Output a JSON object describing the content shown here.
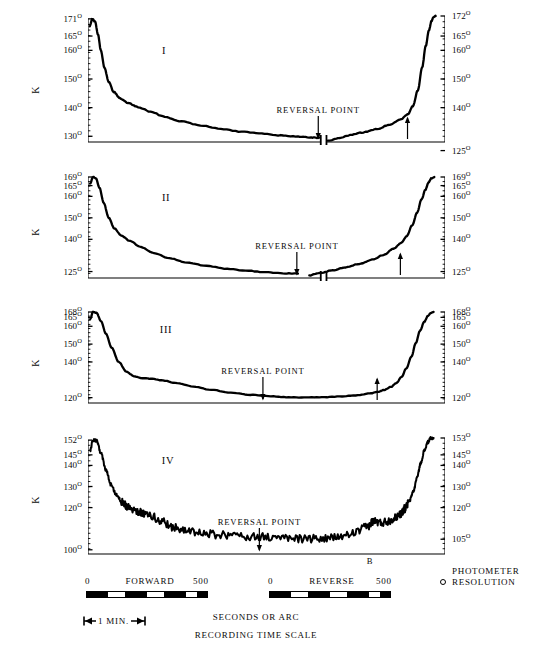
{
  "figure": {
    "axis_title": "K",
    "reversal_label": "REVERSAL POINT",
    "b_marker": "B"
  },
  "legend": {
    "forward_label": "FORWARD",
    "reverse_label": "REVERSE",
    "forward_start": "0",
    "forward_end": "500",
    "reverse_start": "0",
    "reverse_end": "500",
    "units_label": "SECONDS OR ARC",
    "time_scale_label": "RECORDING TIME SCALE",
    "minute_label": "1 MIN.",
    "photometer_line1": "PHOTOMETER",
    "photometer_line2": "RESOLUTION"
  },
  "chart_data": {
    "type": "line",
    "title": "",
    "xlabel": "SECONDS OR ARC",
    "ylabel": "K",
    "grid": false,
    "legend_position": "none",
    "panels": [
      {
        "name": "I",
        "left_axis_ticks": [
          "171",
          "165",
          "160",
          "150",
          "140",
          "130"
        ],
        "left_axis_values": [
          171,
          165,
          160,
          150,
          140,
          130
        ],
        "right_axis_ticks": [
          "172",
          "165",
          "160",
          "150",
          "140",
          "125"
        ],
        "right_axis_values": [
          172,
          165,
          160,
          150,
          140,
          125
        ],
        "ylim": [
          128,
          172
        ],
        "has_trace_break": true,
        "reversal_point_x_frac": 0.645,
        "arrow_right_x_frac": 0.895,
        "forward": {
          "x_frac": [
            0.005,
            0.012,
            0.02,
            0.028,
            0.036,
            0.046,
            0.058,
            0.072,
            0.09,
            0.112,
            0.14,
            0.175,
            0.215,
            0.262,
            0.315,
            0.372,
            0.43,
            0.487,
            0.54,
            0.588,
            0.625,
            0.648
          ],
          "values": [
            168.5,
            171.0,
            170.0,
            165.5,
            160.0,
            154.0,
            149.0,
            145.5,
            143.2,
            141.6,
            140.2,
            138.6,
            136.8,
            135.2,
            133.8,
            132.6,
            131.6,
            130.9,
            130.3,
            129.9,
            129.6,
            129.5
          ]
        },
        "reverse": {
          "x_frac": [
            0.672,
            0.7,
            0.735,
            0.772,
            0.81,
            0.845,
            0.875,
            0.895,
            0.91,
            0.924,
            0.936,
            0.946,
            0.955,
            0.962,
            0.968,
            0.974
          ],
          "values": [
            128.4,
            129.4,
            130.4,
            131.4,
            132.6,
            134.0,
            135.8,
            137.6,
            140.5,
            146.0,
            154.0,
            161.5,
            167.0,
            170.2,
            171.7,
            172.0
          ]
        }
      },
      {
        "name": "II",
        "left_axis_ticks": [
          "169",
          "165",
          "160",
          "150",
          "140",
          "125"
        ],
        "left_axis_values": [
          169,
          165,
          160,
          150,
          140,
          125
        ],
        "right_axis_ticks": [
          "169",
          "165",
          "160",
          "150",
          "140",
          "125"
        ],
        "right_axis_values": [
          169,
          165,
          160,
          150,
          140,
          125
        ],
        "ylim": [
          122,
          169
        ],
        "has_trace_break": true,
        "reversal_point_x_frac": 0.585,
        "arrow_right_x_frac": 0.875,
        "forward": {
          "x_frac": [
            0.006,
            0.014,
            0.022,
            0.032,
            0.044,
            0.058,
            0.074,
            0.094,
            0.118,
            0.148,
            0.185,
            0.228,
            0.278,
            0.332,
            0.39,
            0.45,
            0.505,
            0.552,
            0.588
          ],
          "values": [
            166.0,
            169.0,
            168.4,
            164.0,
            157.0,
            150.0,
            145.0,
            141.6,
            139.2,
            136.4,
            133.6,
            131.2,
            129.2,
            127.6,
            126.3,
            125.3,
            124.6,
            124.2,
            124.0
          ]
        },
        "reverse": {
          "x_frac": [
            0.62,
            0.65,
            0.685,
            0.722,
            0.76,
            0.796,
            0.828,
            0.856,
            0.876,
            0.893,
            0.908,
            0.922,
            0.934,
            0.945,
            0.954,
            0.962,
            0.97
          ],
          "values": [
            123.2,
            124.3,
            125.6,
            127.0,
            128.6,
            130.5,
            132.8,
            135.6,
            138.2,
            141.5,
            146.5,
            152.5,
            158.5,
            163.0,
            166.5,
            168.4,
            169.0
          ]
        }
      },
      {
        "name": "III",
        "left_axis_ticks": [
          "168",
          "165",
          "160",
          "150",
          "140",
          "120"
        ],
        "left_axis_values": [
          168,
          165,
          160,
          150,
          140,
          120
        ],
        "right_axis_ticks": [
          "168",
          "165",
          "160",
          "150",
          "140",
          "120"
        ],
        "right_axis_values": [
          168,
          165,
          160,
          150,
          140,
          120
        ],
        "ylim": [
          117,
          168
        ],
        "has_trace_break": false,
        "reversal_point_x_frac": 0.49,
        "arrow_right_x_frac": 0.81,
        "forward": {
          "x_frac": [
            0.006,
            0.014,
            0.024,
            0.036,
            0.05,
            0.066,
            0.086,
            0.108,
            0.13,
            0.15,
            0.175,
            0.21,
            0.25,
            0.295,
            0.345,
            0.4,
            0.455,
            0.505,
            0.555,
            0.605,
            0.655,
            0.705,
            0.75,
            0.79,
            0.812,
            0.83,
            0.848,
            0.864,
            0.878,
            0.892,
            0.906,
            0.918,
            0.93,
            0.942,
            0.952,
            0.96,
            0.968
          ],
          "values": [
            164.0,
            168.0,
            167.5,
            163.0,
            156.0,
            148.0,
            140.0,
            134.5,
            131.8,
            131.0,
            130.6,
            129.6,
            128.0,
            126.2,
            124.4,
            122.8,
            121.6,
            120.8,
            120.3,
            120.1,
            120.2,
            120.6,
            121.3,
            122.4,
            123.2,
            124.4,
            126.0,
            128.2,
            131.5,
            136.5,
            143.0,
            150.5,
            157.5,
            162.5,
            165.8,
            167.4,
            168.0
          ]
        }
      },
      {
        "name": "IV",
        "left_axis_ticks": [
          "152",
          "145",
          "140",
          "130",
          "120",
          "100"
        ],
        "left_axis_values": [
          152,
          145,
          140,
          130,
          120,
          100
        ],
        "right_axis_ticks": [
          "153",
          "145",
          "140",
          "130",
          "120",
          "105"
        ],
        "right_axis_values": [
          153,
          145,
          140,
          130,
          120,
          105
        ],
        "ylim": [
          98,
          153
        ],
        "has_trace_break": false,
        "noisy": true,
        "reversal_point_x_frac": 0.48,
        "b_marker_x_frac": 0.79,
        "forward": {
          "x_frac": [
            0.006,
            0.014,
            0.024,
            0.036,
            0.05,
            0.064,
            0.08,
            0.096,
            0.112,
            0.13,
            0.15,
            0.175,
            0.205,
            0.24,
            0.28,
            0.325,
            0.375,
            0.425,
            0.475,
            0.525,
            0.575,
            0.625,
            0.672,
            0.715,
            0.752,
            0.782,
            0.8,
            0.82,
            0.84,
            0.858,
            0.874,
            0.888,
            0.9,
            0.912,
            0.922,
            0.932,
            0.942,
            0.952,
            0.96,
            0.968
          ],
          "values": [
            147.0,
            152.0,
            151.6,
            146.0,
            138.0,
            131.0,
            126.0,
            122.5,
            120.6,
            119.0,
            117.5,
            116.2,
            113.5,
            110.8,
            108.8,
            107.6,
            107.0,
            106.6,
            106.2,
            105.8,
            105.4,
            105.2,
            105.4,
            106.4,
            108.4,
            111.0,
            113.6,
            112.8,
            113.6,
            115.0,
            117.0,
            119.5,
            123.0,
            128.0,
            134.5,
            141.0,
            147.0,
            151.0,
            152.8,
            153.0
          ]
        }
      }
    ]
  }
}
